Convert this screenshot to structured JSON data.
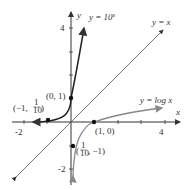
{
  "axes": {
    "x_label": "x",
    "y_label": "y",
    "x_ticks": [
      "-2",
      "4"
    ],
    "y_ticks": [
      "4",
      "-2"
    ]
  },
  "curves": {
    "exp": {
      "label": "y = 10",
      "exponent": "x"
    },
    "identity": {
      "label": "y = x"
    },
    "log": {
      "label": "y = log x"
    }
  },
  "points": {
    "p01": "(0, 1)",
    "p10": "(1, 0)",
    "pneg": {
      "open": "(−1, ",
      "num": "1",
      "den": "10",
      "close": ")"
    },
    "plog": {
      "open": "(",
      "num": "1",
      "den": "10",
      "close": ", −1)"
    }
  },
  "colors": {
    "exp": "#222222",
    "log": "#888888",
    "axis": "#333333",
    "line": "#555555"
  }
}
